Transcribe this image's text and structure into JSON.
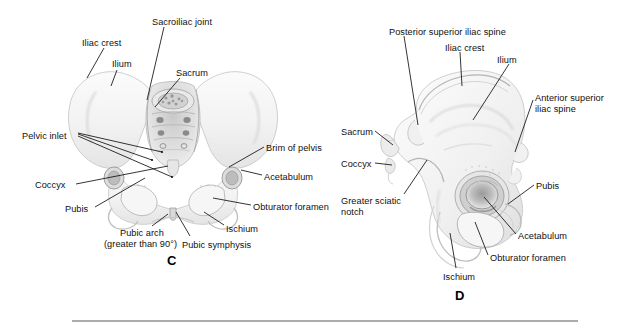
{
  "figure": {
    "title_hidden": "",
    "background_color": "#ffffff",
    "bone_fill": "#f4f4f4",
    "bone_shade": "#d6d6d6",
    "line_color": "#111111",
    "rule_color": "#5a5a5a"
  },
  "panels": [
    {
      "id": "C",
      "letter": "C",
      "caption_subject": "female pelvis, anterior view",
      "labels": [
        {
          "name": "iliac-crest",
          "text": "Iliac crest",
          "x": 82,
          "y": 38
        },
        {
          "name": "ilium",
          "text": "Ilium",
          "x": 112,
          "y": 59
        },
        {
          "name": "sacroiliac-joint",
          "text": "Sacroiliac joint",
          "x": 152,
          "y": 17
        },
        {
          "name": "sacrum",
          "text": "Sacrum",
          "x": 176,
          "y": 68
        },
        {
          "name": "pelvic-inlet",
          "text": "Pelvic inlet",
          "x": 22,
          "y": 131
        },
        {
          "name": "brim-of-pelvis",
          "text": "Brim of pelvis",
          "x": 266,
          "y": 143
        },
        {
          "name": "acetabulum",
          "text": "Acetabulum",
          "x": 264,
          "y": 172
        },
        {
          "name": "coccyx",
          "text": "Coccyx",
          "x": 35,
          "y": 180
        },
        {
          "name": "obturator-foramen",
          "text": "Obturator foramen",
          "x": 253,
          "y": 202
        },
        {
          "name": "pubis",
          "text": "Pubis",
          "x": 65,
          "y": 204
        },
        {
          "name": "ischium",
          "text": "Ischium",
          "x": 226,
          "y": 224
        },
        {
          "name": "pubic-arch",
          "text": "Pubic arch",
          "x": 120,
          "y": 228
        },
        {
          "name": "pubic-arch-note",
          "text": "(greater than 90°)",
          "x": 104,
          "y": 239
        },
        {
          "name": "pubic-symphysis",
          "text": "Pubic symphysis",
          "x": 182,
          "y": 240
        }
      ],
      "letter_pos": {
        "x": 167,
        "y": 260
      }
    },
    {
      "id": "D",
      "letter": "D",
      "caption_subject": "hip bone, lateral view",
      "labels": [
        {
          "name": "posterior-superior-iliac-spine",
          "text": "Posterior superior iliac spine",
          "x": 389,
          "y": 27
        },
        {
          "name": "iliac-crest",
          "text": "Iliac crest",
          "x": 445,
          "y": 43
        },
        {
          "name": "ilium",
          "text": "Ilium",
          "x": 497,
          "y": 55
        },
        {
          "name": "anterior-superior-iliac-spine-1",
          "text": "Anterior superior",
          "x": 535,
          "y": 93
        },
        {
          "name": "anterior-superior-iliac-spine-2",
          "text": "iliac spine",
          "x": 535,
          "y": 104
        },
        {
          "name": "sacrum",
          "text": "Sacrum",
          "x": 341,
          "y": 127
        },
        {
          "name": "coccyx",
          "text": "Coccyx",
          "x": 341,
          "y": 159
        },
        {
          "name": "greater-sciatic-notch-1",
          "text": "Greater sciatic",
          "x": 341,
          "y": 196
        },
        {
          "name": "greater-sciatic-notch-2",
          "text": "notch",
          "x": 341,
          "y": 207
        },
        {
          "name": "pubis",
          "text": "Pubis",
          "x": 536,
          "y": 181
        },
        {
          "name": "acetabulum",
          "text": "Acetabulum",
          "x": 518,
          "y": 231
        },
        {
          "name": "obturator-foramen",
          "text": "Obturator foramen",
          "x": 490,
          "y": 253
        },
        {
          "name": "ischium",
          "text": "Ischium",
          "x": 443,
          "y": 272
        }
      ],
      "letter_pos": {
        "x": 455,
        "y": 295
      }
    }
  ],
  "rule": {
    "x1": 72,
    "x2": 578,
    "y": 321
  }
}
